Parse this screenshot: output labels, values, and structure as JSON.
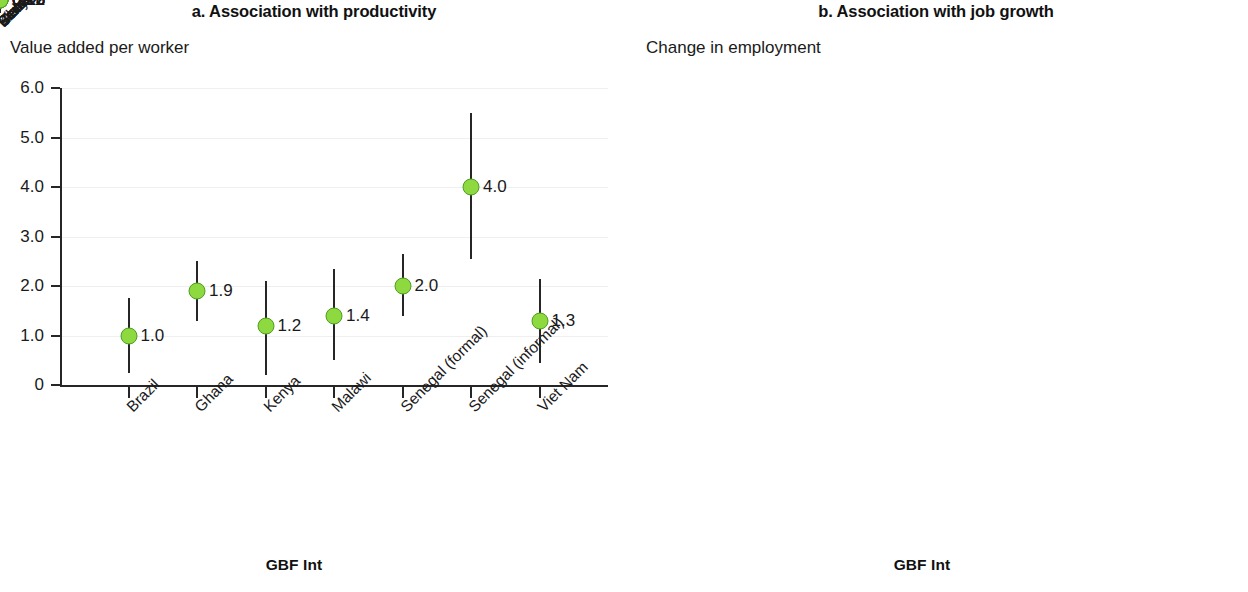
{
  "figure": {
    "panels": [
      {
        "key": "a",
        "title": "a. Association with productivity",
        "y_axis_label": "Value added per worker",
        "x_axis_label": "GBF Int"
      },
      {
        "key": "b",
        "title": "b. Association with job growth",
        "y_axis_label": "Change in employment",
        "x_axis_label": "GBF Int"
      }
    ]
  },
  "colors": {
    "marker_fill": "#8ed93f",
    "marker_edge": "#4d9e1f",
    "axis": "#262626",
    "gridline": "#efefef",
    "text": "#1a1a1a",
    "background": "#ffffff"
  },
  "chart_data": [
    {
      "type": "scatter",
      "panel": "a",
      "title": "a. Association with productivity",
      "subtitle": "Value added per worker",
      "xlabel": "GBF Int",
      "ylabel": "Value added per worker",
      "categories": [
        "Brazil",
        "Ghana",
        "Kenya",
        "Malawi",
        "Senegal (formal)",
        "Senegal (informal)",
        "Viet Nam"
      ],
      "values": [
        1.0,
        1.9,
        1.2,
        1.4,
        2.0,
        4.0,
        1.3
      ],
      "point_labels": [
        "1.0",
        "1.9",
        "1.2",
        "1.4",
        "2.0",
        "4.0",
        "1.3"
      ],
      "error_low": [
        0.25,
        1.3,
        0.2,
        0.5,
        1.4,
        2.55,
        0.45
      ],
      "error_high": [
        1.75,
        2.5,
        2.1,
        2.35,
        2.65,
        5.5,
        2.15
      ],
      "ylim": [
        0,
        6.0
      ],
      "ytick_values": [
        0,
        1.0,
        2.0,
        3.0,
        4.0,
        5.0,
        6.0
      ],
      "ytick_labels": [
        "0",
        "1.0",
        "2.0",
        "3.0",
        "4.0",
        "5.0",
        "6.0"
      ],
      "grid": true,
      "legend": "none"
    },
    {
      "type": "scatter",
      "panel": "b",
      "title": "b. Association with job growth",
      "subtitle": "Change in employment",
      "xlabel": "GBF Int",
      "ylabel": "Change in employment",
      "categories": [
        "Brazil",
        "Ghana",
        "Kenya",
        "Malawi",
        "Senegal (formal)",
        "Senegal (informal)",
        "Viet Nam"
      ],
      "values": [
        0.16,
        0.23,
        0.03,
        0.11,
        0.1,
        0.12,
        0.15
      ],
      "point_labels": [
        "0.16",
        "0.23",
        "0.03",
        "0.11",
        "0.10",
        "0.12",
        "0.15"
      ],
      "error_low": [
        0.08,
        0.135,
        -0.03,
        -0.015,
        0.025,
        -0.03,
        -0.025
      ],
      "error_high": [
        0.23,
        0.315,
        0.105,
        0.228,
        0.165,
        0.265,
        0.33
      ],
      "ylim": [
        -0.045,
        0.4
      ],
      "ytick_values": [
        0,
        0.1,
        0.2,
        0.3,
        0.4
      ],
      "ytick_labels": [
        "0",
        "0.1",
        "0.2",
        "0.3",
        "0.4"
      ],
      "grid": true,
      "legend": "none"
    }
  ]
}
